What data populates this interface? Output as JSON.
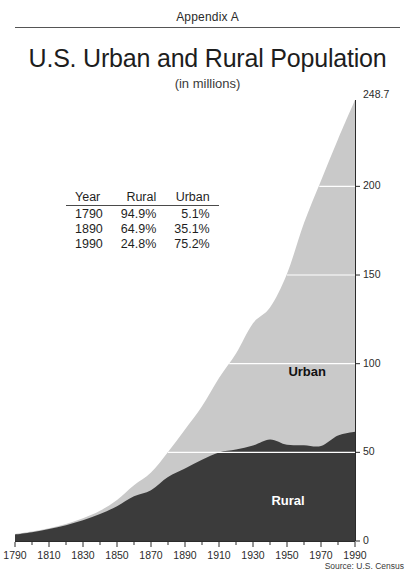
{
  "header": {
    "appendix_label": "Appendix A"
  },
  "title": "U.S. Urban and Rural Population",
  "subtitle": "(in millions)",
  "source_note": "Source: U.S. Census",
  "table": {
    "columns": [
      "Year",
      "Rural",
      "Urban"
    ],
    "rows": [
      [
        "1790",
        "94.9%",
        "5.1%"
      ],
      [
        "1890",
        "64.9%",
        "35.1%"
      ],
      [
        "1990",
        "24.8%",
        "75.2%"
      ]
    ]
  },
  "series_labels": {
    "urban": "Urban",
    "rural": "Rural"
  },
  "colors": {
    "urban": "#c9c9c9",
    "rural": "#3b3b3b",
    "gridline": "#ffffff",
    "axis": "#2b2b2b",
    "background": "#ffffff"
  },
  "chart_data": {
    "type": "area",
    "stacked": true,
    "title": "U.S. Urban and Rural Population",
    "subtitle": "(in millions)",
    "xlabel": "",
    "ylabel": "",
    "xlim": [
      1790,
      1990
    ],
    "ylim": [
      0,
      248.7
    ],
    "grid": true,
    "legend": "inline-labels",
    "y_ticks": [
      0,
      50,
      100,
      150,
      200
    ],
    "y_tick_labels": [
      "0",
      "50",
      "100",
      "150",
      "200"
    ],
    "y_top_label": "248.7",
    "x_ticks": [
      1790,
      1810,
      1830,
      1850,
      1870,
      1890,
      1910,
      1930,
      1950,
      1970,
      1990
    ],
    "x_tick_labels": [
      "1790",
      "1810",
      "1830",
      "1850",
      "1870",
      "1890",
      "1910",
      "1930",
      "1950",
      "1970",
      "1990"
    ],
    "x_minor_tick_step": 10,
    "x": [
      1790,
      1800,
      1810,
      1820,
      1830,
      1840,
      1850,
      1860,
      1870,
      1880,
      1890,
      1900,
      1910,
      1920,
      1930,
      1940,
      1950,
      1960,
      1970,
      1980,
      1990
    ],
    "series": [
      {
        "name": "Rural",
        "values": [
          3.7,
          4.99,
          6.71,
          8.95,
          11.73,
          15.22,
          19.65,
          25.23,
          28.66,
          36.03,
          40.84,
          45.83,
          49.97,
          51.55,
          53.82,
          57.25,
          54.23,
          54.05,
          53.57,
          59.49,
          61.66
        ]
      },
      {
        "name": "Urban",
        "values": [
          0.2,
          0.32,
          0.52,
          0.69,
          1.13,
          1.85,
          3.54,
          6.22,
          9.9,
          14.13,
          22.11,
          30.16,
          41.99,
          54.16,
          68.95,
          74.42,
          96.47,
          125.27,
          149.65,
          167.05,
          187.05
        ]
      }
    ],
    "totals": [
      3.9,
      5.31,
      7.24,
      9.64,
      12.87,
      17.07,
      23.19,
      31.44,
      38.56,
      50.16,
      62.95,
      75.99,
      91.97,
      105.71,
      122.78,
      131.67,
      150.7,
      179.32,
      203.21,
      226.55,
      248.7
    ]
  },
  "plot_geometry": {
    "x_left": 15,
    "x_right": 355,
    "y_zero": 541,
    "y_top": 100
  }
}
